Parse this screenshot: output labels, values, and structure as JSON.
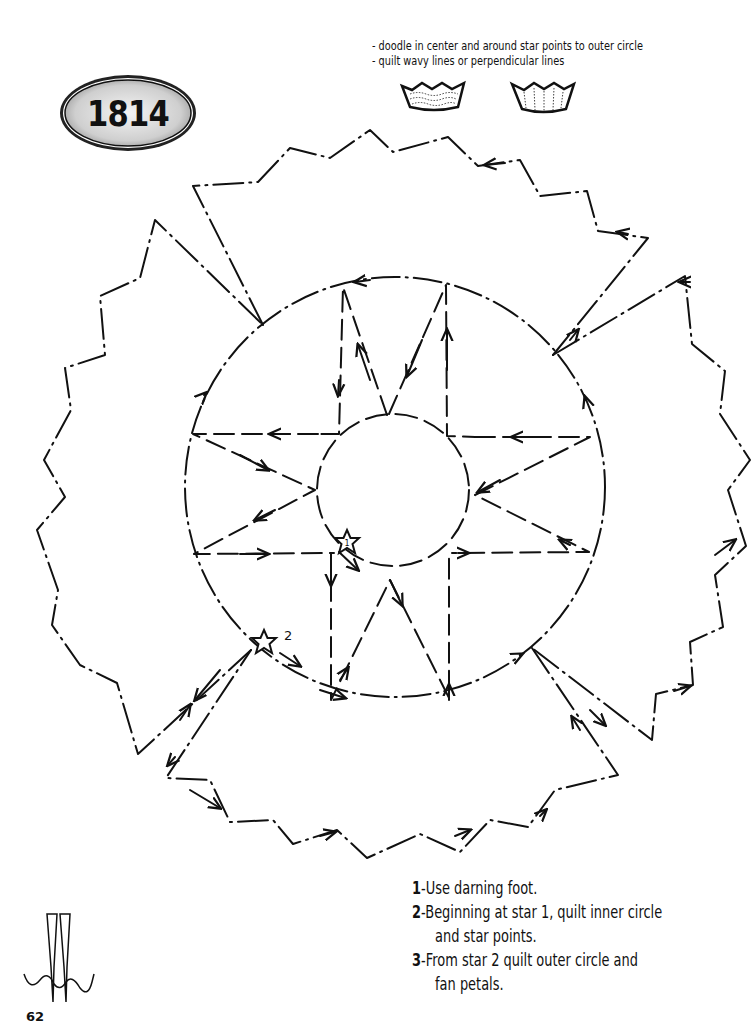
{
  "badge": {
    "label": "1814"
  },
  "notes": {
    "lines": [
      "- doodle in center and around star points to outer circle",
      "- quilt wavy lines or perpendicular lines"
    ],
    "samples": [
      {
        "name": "wavy-lines-sample",
        "description": "petal with wavy quilting lines"
      },
      {
        "name": "perpendicular-lines-sample",
        "description": "petal with perpendicular quilting lines"
      }
    ]
  },
  "diagram": {
    "star_markers": [
      {
        "id": "star-1",
        "label": "1"
      },
      {
        "id": "star-2",
        "label": "2"
      }
    ],
    "stroke_color": "#111111",
    "background_color": "#ffffff"
  },
  "instructions": [
    {
      "num": "1",
      "text": "-Use darning foot.",
      "cont": ""
    },
    {
      "num": "2",
      "text": "-Beginning at star 1, quilt inner circle",
      "cont": "and star points."
    },
    {
      "num": "3",
      "text": "-From star 2 quilt outer circle and",
      "cont": "fan petals."
    }
  ],
  "footer": {
    "page_number": "62"
  }
}
